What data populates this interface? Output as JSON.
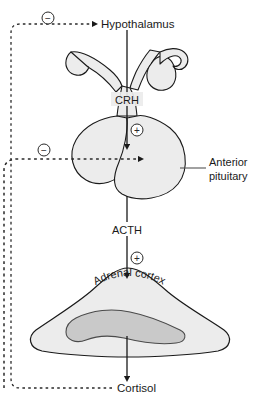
{
  "diagram": {
    "colors": {
      "stroke": "#1a1a1a",
      "text": "#1a1a1a",
      "organ_fill": "#ececec",
      "medulla_fill": "#c9c9c9",
      "leader_line": "#555555",
      "dashed_feedback": "#2a2a2a",
      "background": "#ffffff"
    },
    "labels": {
      "hypothalamus": "Hypothalamus",
      "crh": "CRH",
      "anterior_pituitary_line1": "Anterior",
      "anterior_pituitary_line2": "pituitary",
      "acth": "ACTH",
      "adrenal_cortex": "Adrenal cortex",
      "cortisol": "Cortisol"
    },
    "signs": {
      "negative_top": "−",
      "negative_middle": "−",
      "positive_crh": "+",
      "positive_acth": "+"
    },
    "flow_steps": [
      {
        "from": "Hypothalamus",
        "hormone": "CRH",
        "to": "Anterior pituitary",
        "effect": "+"
      },
      {
        "from": "Anterior pituitary",
        "hormone": "ACTH",
        "to": "Adrenal cortex",
        "effect": "+"
      },
      {
        "from": "Adrenal cortex",
        "hormone": "Cortisol",
        "to": "",
        "effect": ""
      }
    ],
    "feedback_loops": [
      {
        "source": "Cortisol",
        "target": "Hypothalamus",
        "effect": "−",
        "style": "dashed"
      },
      {
        "source": "Cortisol",
        "target": "Anterior pituitary",
        "effect": "−",
        "style": "dashed"
      }
    ]
  }
}
